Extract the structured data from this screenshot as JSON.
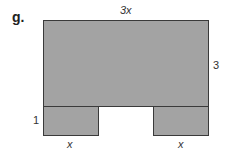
{
  "problem_label": "g.",
  "figure": {
    "fill_color": "#a3a3a3",
    "stroke_color": "#3a3a3a",
    "top_rect": {
      "width_label": "3x",
      "height_label": "3"
    },
    "bottom_left_rect": {
      "width_label": "x",
      "height_label": "1"
    },
    "bottom_right_rect": {
      "width_label": "x"
    }
  }
}
